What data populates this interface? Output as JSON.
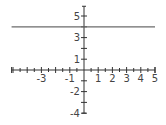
{
  "chart_data": {
    "type": "line",
    "title": "",
    "xlabel": "",
    "ylabel": "",
    "xlim": [
      -5.1,
      5
    ],
    "ylim": [
      -4,
      5.9
    ],
    "grid": false,
    "legend": null,
    "x_tick_labels": [
      "-3",
      "-1",
      "1",
      "2",
      "3",
      "4",
      "5"
    ],
    "x_tick_label_values": [
      -3,
      -1,
      1,
      2,
      3,
      4,
      5
    ],
    "x_minor_tick_step": 0.5,
    "y_tick_labels": [
      "5",
      "3",
      "1",
      "-2",
      "-4"
    ],
    "y_tick_label_values": [
      5,
      3,
      1,
      -2,
      -4
    ],
    "y_minor_tick_step": 1,
    "series": [
      {
        "name": "y = 4",
        "x": [
          -5.1,
          5
        ],
        "values": [
          4,
          4
        ],
        "color": "#6b6b6b"
      }
    ]
  },
  "layout": {
    "origin_px": [
      84,
      70
    ],
    "x_unit_px": 14.2,
    "y_unit_px": 10.8
  }
}
